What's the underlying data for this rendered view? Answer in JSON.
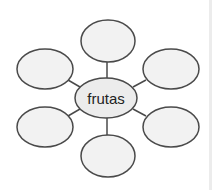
{
  "diagram": {
    "type": "mind-map",
    "center": {
      "label": "frutas",
      "cx": 106,
      "cy": 98,
      "rx": 31,
      "ry": 20
    },
    "nodes": [
      {
        "position": "top",
        "label": "",
        "cx": 108,
        "cy": 41,
        "rx": 27,
        "ry": 21
      },
      {
        "position": "upper-left",
        "label": "",
        "cx": 45,
        "cy": 69,
        "rx": 28,
        "ry": 20
      },
      {
        "position": "upper-right",
        "label": "",
        "cx": 171,
        "cy": 69,
        "rx": 28,
        "ry": 20
      },
      {
        "position": "lower-left",
        "label": "",
        "cx": 45,
        "cy": 127,
        "rx": 28,
        "ry": 20
      },
      {
        "position": "lower-right",
        "label": "",
        "cx": 171,
        "cy": 127,
        "rx": 28,
        "ry": 20
      },
      {
        "position": "bottom",
        "label": "",
        "cx": 108,
        "cy": 156,
        "rx": 27,
        "ry": 21
      }
    ],
    "colors": {
      "stroke": "#4a4a4a",
      "fill": "#f2f2f2",
      "line": "#4a4a4a"
    }
  }
}
